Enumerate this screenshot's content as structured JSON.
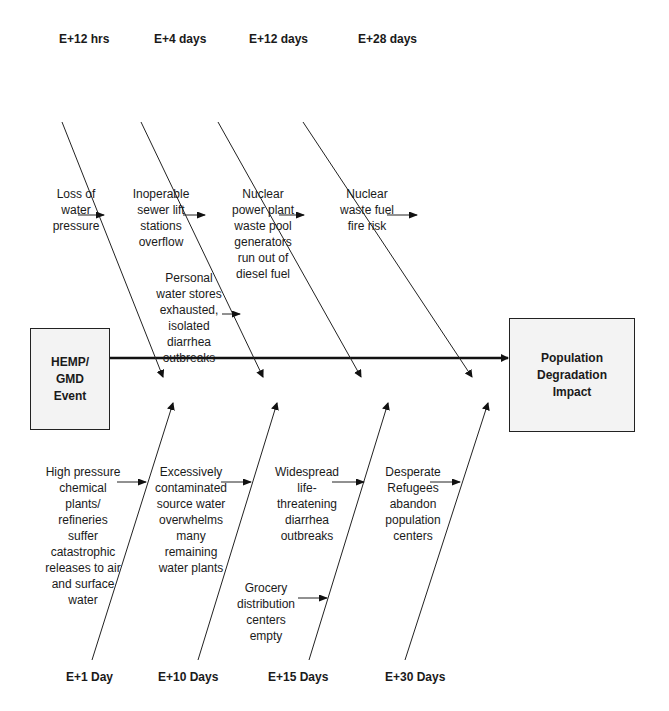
{
  "diagram": {
    "type": "fishbone",
    "source_box": {
      "label": "HEMP/\nGMD\nEvent"
    },
    "effect_box": {
      "label": "Population\nDegradation\nImpact"
    },
    "top_timeline": [
      "E+12 hrs",
      "E+4 days",
      "E+12 days",
      "E+28 days"
    ],
    "bottom_timeline": [
      "E+1 Day",
      "E+10 Days",
      "E+15 Days",
      "E+30 Days"
    ],
    "top_causes": [
      {
        "label": "Loss of\nwater\npressure"
      },
      {
        "label": "Inoperable\nsewer lift\nstations\noverflow"
      },
      {
        "label": "Nuclear\npower plant\nwaste pool\ngenerators\nrun out of\ndiesel fuel"
      },
      {
        "label": "Nuclear\nwaste fuel\nfire risk"
      },
      {
        "label": "Personal\nwater stores\nexhausted,\nisolated\ndiarrhea\noutbreaks"
      }
    ],
    "bottom_causes": [
      {
        "label": "High pressure\nchemical\nplants/\nrefineries\nsuffer\ncatastrophic\nreleases to air\nand surface\nwater"
      },
      {
        "label": "Excessively\ncontaminated\nsource water\noverwhelms\nmany\nremaining\nwater plants"
      },
      {
        "label": "Widespread\nlife-\nthreatening\ndiarrhea\noutbreaks"
      },
      {
        "label": "Desperate\nRefugees\nabandon\npopulation\ncenters"
      },
      {
        "label": "Grocery\ndistribution\ncenters\nempty"
      }
    ],
    "colors": {
      "line": "#222222",
      "box_fill": "#f3f3f3"
    }
  }
}
